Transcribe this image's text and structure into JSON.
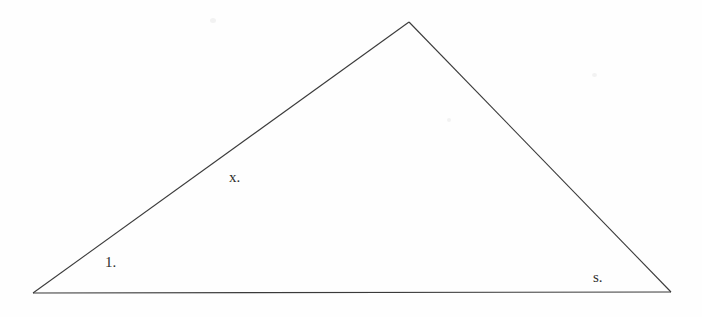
{
  "figure": {
    "kind": "triangle-diagram",
    "background_color": "#fefefe",
    "stroke_color": "#3a3a3a",
    "stroke_width": 1,
    "canvas": {
      "width": 702,
      "height": 317
    },
    "vertices": [
      {
        "name": "left-vertex",
        "x": 33,
        "y": 293
      },
      {
        "name": "apex-vertex",
        "x": 409,
        "y": 22
      },
      {
        "name": "right-vertex",
        "x": 671,
        "y": 292
      }
    ],
    "edges": [
      {
        "name": "left-side",
        "from": "left-vertex",
        "to": "apex-vertex"
      },
      {
        "name": "right-side",
        "from": "apex-vertex",
        "to": "right-vertex"
      },
      {
        "name": "base-side",
        "from": "right-vertex",
        "to": "left-vertex"
      }
    ]
  },
  "labels": {
    "left_angle": "1.",
    "left_side": "x.",
    "right_angle": "s."
  },
  "label_positions": {
    "left_angle": {
      "x": 105,
      "y": 255
    },
    "left_side": {
      "x": 229,
      "y": 170
    },
    "right_angle": {
      "x": 593,
      "y": 270
    }
  },
  "chart_data": {
    "type": "diagram",
    "title": "",
    "shape": "triangle",
    "points": [
      {
        "label": "left-vertex",
        "x": 33,
        "y": 293
      },
      {
        "label": "apex-vertex",
        "x": 409,
        "y": 22
      },
      {
        "label": "right-vertex",
        "x": 671,
        "y": 292
      }
    ],
    "annotations": [
      {
        "text": "1.",
        "x": 105,
        "y": 262,
        "near": "left-vertex"
      },
      {
        "text": "x.",
        "x": 229,
        "y": 178,
        "near": "left-side"
      },
      {
        "text": "s.",
        "x": 593,
        "y": 277,
        "near": "right-vertex"
      }
    ]
  }
}
